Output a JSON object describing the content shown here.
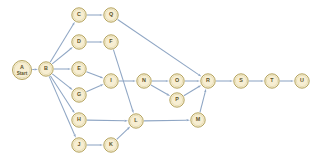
{
  "diagram": {
    "type": "directed-graph",
    "title": "",
    "canvas": {
      "width": 313,
      "height": 161,
      "background": "#ffffff"
    },
    "style": {
      "node_fill": "#f7eed2",
      "node_stroke": "#b5a45f",
      "node_radius": 7.2,
      "edge_color": "#8fa6c4",
      "label_color": "#5c5228"
    },
    "nodes": [
      {
        "id": "A",
        "label": "A",
        "sublabel": "Start",
        "x": 22,
        "y": 70,
        "r": 9.5
      },
      {
        "id": "B",
        "label": "B",
        "sublabel": "",
        "x": 46,
        "y": 69,
        "r": 7.2
      },
      {
        "id": "C",
        "label": "C",
        "sublabel": "",
        "x": 79,
        "y": 15,
        "r": 7.2
      },
      {
        "id": "Q",
        "label": "Q",
        "sublabel": "",
        "x": 111,
        "y": 15,
        "r": 7.2
      },
      {
        "id": "D",
        "label": "D",
        "sublabel": "",
        "x": 79,
        "y": 42,
        "r": 7.2
      },
      {
        "id": "F",
        "label": "F",
        "sublabel": "",
        "x": 111,
        "y": 42,
        "r": 7.2
      },
      {
        "id": "E",
        "label": "E",
        "sublabel": "",
        "x": 79,
        "y": 69,
        "r": 7.2
      },
      {
        "id": "I",
        "label": "I",
        "sublabel": "",
        "x": 111,
        "y": 81,
        "r": 7.2
      },
      {
        "id": "G",
        "label": "G",
        "sublabel": "",
        "x": 79,
        "y": 95,
        "r": 7.2
      },
      {
        "id": "N",
        "label": "N",
        "sublabel": "",
        "x": 144,
        "y": 81,
        "r": 7.2
      },
      {
        "id": "O",
        "label": "O",
        "sublabel": "",
        "x": 177,
        "y": 81,
        "r": 7.2
      },
      {
        "id": "P",
        "label": "P",
        "sublabel": "",
        "x": 177,
        "y": 100,
        "r": 7.2
      },
      {
        "id": "R",
        "label": "R",
        "sublabel": "",
        "x": 208,
        "y": 81,
        "r": 7.2
      },
      {
        "id": "S",
        "label": "S",
        "sublabel": "",
        "x": 241,
        "y": 81,
        "r": 7.2
      },
      {
        "id": "T",
        "label": "T",
        "sublabel": "",
        "x": 272,
        "y": 81,
        "r": 7.2
      },
      {
        "id": "U",
        "label": "U",
        "sublabel": "",
        "x": 302,
        "y": 81,
        "r": 7.2
      },
      {
        "id": "H",
        "label": "H",
        "sublabel": "",
        "x": 79,
        "y": 120,
        "r": 7.2
      },
      {
        "id": "L",
        "label": "L",
        "sublabel": "",
        "x": 136,
        "y": 121,
        "r": 7.2
      },
      {
        "id": "M",
        "label": "M",
        "sublabel": "",
        "x": 198,
        "y": 120,
        "r": 7.2
      },
      {
        "id": "J",
        "label": "J",
        "sublabel": "",
        "x": 79,
        "y": 145,
        "r": 7.2
      },
      {
        "id": "K",
        "label": "K",
        "sublabel": "",
        "x": 111,
        "y": 145,
        "r": 7.2
      }
    ],
    "edges": [
      {
        "from": "A",
        "to": "B"
      },
      {
        "from": "B",
        "to": "C"
      },
      {
        "from": "B",
        "to": "D"
      },
      {
        "from": "B",
        "to": "E"
      },
      {
        "from": "B",
        "to": "G"
      },
      {
        "from": "B",
        "to": "H"
      },
      {
        "from": "B",
        "to": "J"
      },
      {
        "from": "C",
        "to": "Q"
      },
      {
        "from": "Q",
        "to": "R"
      },
      {
        "from": "D",
        "to": "F"
      },
      {
        "from": "F",
        "to": "L"
      },
      {
        "from": "E",
        "to": "I"
      },
      {
        "from": "G",
        "to": "I"
      },
      {
        "from": "I",
        "to": "N"
      },
      {
        "from": "N",
        "to": "O"
      },
      {
        "from": "N",
        "to": "P"
      },
      {
        "from": "O",
        "to": "R"
      },
      {
        "from": "P",
        "to": "R"
      },
      {
        "from": "R",
        "to": "S"
      },
      {
        "from": "S",
        "to": "T"
      },
      {
        "from": "T",
        "to": "U"
      },
      {
        "from": "H",
        "to": "L"
      },
      {
        "from": "J",
        "to": "K"
      },
      {
        "from": "K",
        "to": "L"
      },
      {
        "from": "L",
        "to": "M"
      },
      {
        "from": "M",
        "to": "R"
      }
    ]
  }
}
